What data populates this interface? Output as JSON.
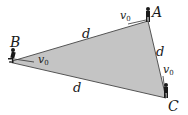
{
  "diagram": {
    "vertices": {
      "A": {
        "label": "A",
        "x": 148,
        "y": 21
      },
      "B": {
        "label": "B",
        "x": 9,
        "y": 62
      },
      "C": {
        "label": "C",
        "x": 166,
        "y": 98
      }
    },
    "sides": {
      "AB": {
        "label": "d"
      },
      "AC": {
        "label": "d"
      },
      "BC": {
        "label": "d"
      }
    },
    "velocities": {
      "A": {
        "label": "v",
        "subscript": "0"
      },
      "B": {
        "label": "v",
        "subscript": "0"
      },
      "C": {
        "label": "v",
        "subscript": "0"
      }
    },
    "colors": {
      "fill": "#c4c4c4",
      "edge": "#555555",
      "figure": "#1a1a1a"
    }
  }
}
